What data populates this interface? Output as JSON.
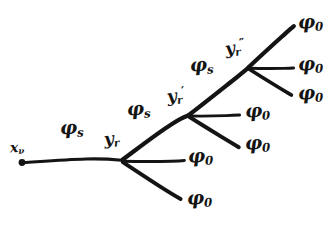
{
  "figure": {
    "kind": "hand-drawn branching tree diagram",
    "background_color": "#ffffff",
    "ink_color": "#141414",
    "width": 331,
    "height": 225
  },
  "source": {
    "name": "source-point",
    "label_base": "x",
    "label_sub": "ν",
    "point": {
      "x": 22,
      "y": 162
    }
  },
  "vertices": [
    {
      "id": "v1",
      "label_base": "y",
      "label_sub": "r",
      "label_prime": "",
      "x": 122,
      "y": 160
    },
    {
      "id": "v2",
      "label_base": "y",
      "label_sub": "r",
      "label_prime": "′",
      "x": 188,
      "y": 116
    },
    {
      "id": "v3",
      "label_base": "y",
      "label_sub": "r",
      "label_prime": "″",
      "x": 248,
      "y": 68
    }
  ],
  "internal_lines": [
    {
      "id": "i1",
      "from": "source",
      "to": "v1",
      "label_base": "φ",
      "label_sub": "s"
    },
    {
      "id": "i2",
      "from": "v1",
      "to": "v2",
      "label_base": "φ",
      "label_sub": "s"
    },
    {
      "id": "i3",
      "from": "v2",
      "to": "v3",
      "label_base": "φ",
      "label_sub": "s"
    }
  ],
  "external_lines": [
    {
      "id": "e1",
      "from": "v1",
      "label_base": "φ",
      "label_sub": "0"
    },
    {
      "id": "e2",
      "from": "v1",
      "label_base": "φ",
      "label_sub": "0"
    },
    {
      "id": "e3",
      "from": "v2",
      "label_base": "φ",
      "label_sub": "0"
    },
    {
      "id": "e4",
      "from": "v2",
      "label_base": "φ",
      "label_sub": "0"
    },
    {
      "id": "e5",
      "from": "v3",
      "label_base": "φ",
      "label_sub": "0"
    },
    {
      "id": "e6",
      "from": "v3",
      "label_base": "φ",
      "label_sub": "0"
    },
    {
      "id": "e7",
      "from": "v3",
      "label_base": "φ",
      "label_sub": "0"
    }
  ],
  "labels": {
    "source": {
      "base": "x",
      "sub": "ν"
    },
    "vertex_1": {
      "base": "y",
      "sub": "r",
      "prime": ""
    },
    "vertex_2": {
      "base": "y",
      "sub": "r",
      "prime": "′"
    },
    "vertex_3": {
      "base": "y",
      "sub": "r",
      "prime": "″"
    },
    "phi_s_1": {
      "base": "φ",
      "sub": "s"
    },
    "phi_s_2": {
      "base": "φ",
      "sub": "s"
    },
    "phi_s_3": {
      "base": "φ",
      "sub": "s"
    },
    "phi_0_1": {
      "base": "φ",
      "sub": "0"
    },
    "phi_0_2": {
      "base": "φ",
      "sub": "0"
    },
    "phi_0_3": {
      "base": "φ",
      "sub": "0"
    },
    "phi_0_4": {
      "base": "φ",
      "sub": "0"
    },
    "phi_0_5": {
      "base": "φ",
      "sub": "0"
    },
    "phi_0_6": {
      "base": "φ",
      "sub": "0"
    },
    "phi_0_7": {
      "base": "φ",
      "sub": "0"
    }
  }
}
